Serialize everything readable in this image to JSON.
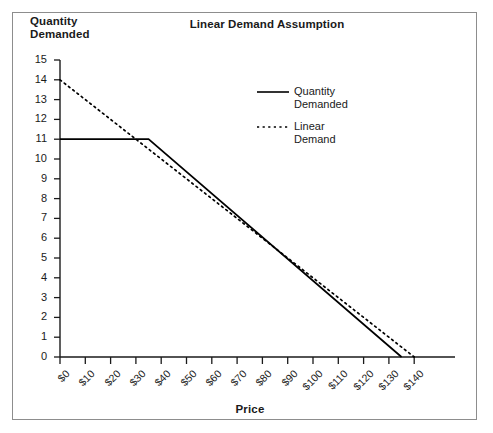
{
  "chart_data": {
    "type": "line",
    "title": "Linear Demand Assumption",
    "xlabel": "Price",
    "ylabel": "Quantity\nDemanded",
    "xlim": [
      0,
      140
    ],
    "ylim": [
      0,
      15
    ],
    "grid": false,
    "legend_position": "inside-upper-right",
    "xticks": [
      "$0",
      "$10",
      "$20",
      "$30",
      "$40",
      "$50",
      "$60",
      "$70",
      "$80",
      "$90",
      "$100",
      "$110",
      "$120",
      "$130",
      "$140"
    ],
    "xtick_values": [
      0,
      10,
      20,
      30,
      40,
      50,
      60,
      70,
      80,
      90,
      100,
      110,
      120,
      130,
      140
    ],
    "yticks": [
      "15",
      "14",
      "13",
      "12",
      "11",
      "10",
      "9",
      "8",
      "7",
      "6",
      "5",
      "4",
      "3",
      "2",
      "1",
      "0"
    ],
    "ytick_values": [
      15,
      14,
      13,
      12,
      11,
      10,
      9,
      8,
      7,
      6,
      5,
      4,
      3,
      2,
      1,
      0
    ],
    "series": [
      {
        "name": "Quantity\nDemanded",
        "legend_label_line1": "Quantity",
        "legend_label_line2": "Demanded",
        "style": "solid",
        "color": "#000000",
        "points": [
          [
            0,
            11
          ],
          [
            35,
            11
          ],
          [
            135,
            0
          ]
        ]
      },
      {
        "name": "Linear\nDemand",
        "legend_label_line1": "Linear",
        "legend_label_line2": "Demand",
        "style": "dotted",
        "color": "#000000",
        "points": [
          [
            0,
            14
          ],
          [
            140,
            0
          ]
        ]
      }
    ]
  },
  "frame": {
    "border_color": "#8d8d8d",
    "background": "#ffffff",
    "axis_color": "#1a1a1a"
  }
}
